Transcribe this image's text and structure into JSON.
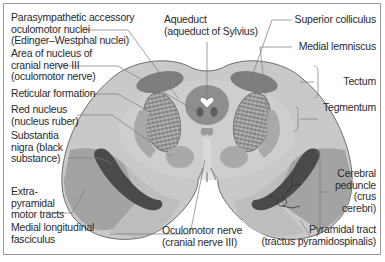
{
  "labels": {
    "left": [
      {
        "id": "edinger_westphal",
        "lines": [
          "Parasympathetic accessory",
          "oculomotor nuclei",
          "(Edinger–Westphal nuclei)"
        ]
      },
      {
        "id": "cn3_nucleus",
        "lines": [
          "Area of nucleus of",
          "cranial nerve III",
          "(oculomotor nerve)"
        ]
      },
      {
        "id": "reticular_formation",
        "lines": [
          "Reticular formation"
        ]
      },
      {
        "id": "red_nucleus",
        "lines": [
          "Red nucleus",
          "(nucleus ruber)"
        ]
      },
      {
        "id": "substantia_nigra",
        "lines": [
          "Substantia",
          "nigra (black",
          "substance)"
        ]
      },
      {
        "id": "extrapyramidal",
        "lines": [
          "Extra-",
          "pyramidal",
          "motor tracts"
        ]
      },
      {
        "id": "mlf",
        "lines": [
          "Medial longitudinal",
          "fasciculus"
        ]
      }
    ],
    "top": [
      {
        "id": "aqueduct",
        "lines": [
          "Aqueduct",
          "(aqueduct of Sylvius)"
        ]
      }
    ],
    "right": [
      {
        "id": "superior_colliculus",
        "lines": [
          "Superior colliculus"
        ]
      },
      {
        "id": "medial_lemniscus",
        "lines": [
          "Medial lemniscus"
        ]
      },
      {
        "id": "tectum",
        "lines": [
          "Tectum"
        ]
      },
      {
        "id": "tegmentum",
        "lines": [
          "Tegmentum"
        ]
      },
      {
        "id": "cerebral_peduncle",
        "lines": [
          "Cerebral",
          "peduncle",
          "(crus",
          "cerebri)"
        ]
      },
      {
        "id": "pyramidal_tract",
        "lines": [
          "Pyramidal tract",
          "(tractus pyramidospinalis)"
        ]
      }
    ],
    "bottom": [
      {
        "id": "oculomotor_nerve",
        "lines": [
          "Oculomotor nerve",
          "(cranial nerve III)"
        ]
      }
    ]
  },
  "colors": {
    "outline": "#6e6e6e",
    "tissue": "#c9c9c9",
    "tissue_light": "#d6d6d6",
    "nucleus_dark": "#7d7d7d",
    "nigra": "#4a4a4a",
    "peduncle_mid": "#a3a3a3",
    "peduncle_light": "#bdbdbd",
    "reticular": "#8a8a8a",
    "leader": "#7a7a7a",
    "text": "#2a2a2a"
  }
}
